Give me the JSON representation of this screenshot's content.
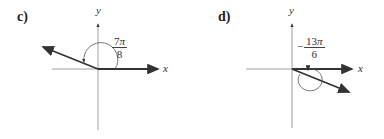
{
  "panels": [
    {
      "id": "c",
      "label": "c)",
      "x_label": "x",
      "y_label": "y",
      "angle": {
        "sign": "",
        "numerator": "7",
        "pi": "π",
        "denominator": "8"
      },
      "angle_description": "7π/8 counterclockwise, terminal side in quadrant II"
    },
    {
      "id": "d",
      "label": "d)",
      "x_label": "x",
      "y_label": "y",
      "angle": {
        "sign": "−",
        "numerator": "13",
        "pi": "π",
        "denominator": "6"
      },
      "angle_description": "−13π/6 clockwise, terminal side in quadrant IV"
    }
  ]
}
